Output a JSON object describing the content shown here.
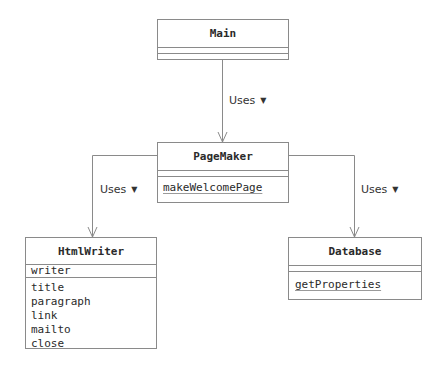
{
  "diagram": {
    "type": "UML class diagram",
    "classes": [
      {
        "id": "main",
        "name": "Main",
        "attributes": [],
        "operations": []
      },
      {
        "id": "pagemaker",
        "name": "PageMaker",
        "attributes": [],
        "operations": [
          {
            "name": "makeWelcomePage",
            "static": true
          }
        ]
      },
      {
        "id": "htmlwriter",
        "name": "HtmlWriter",
        "attributes": [
          {
            "name": "writer"
          }
        ],
        "operations": [
          {
            "name": "title"
          },
          {
            "name": "paragraph"
          },
          {
            "name": "link"
          },
          {
            "name": "mailto"
          },
          {
            "name": "close"
          }
        ]
      },
      {
        "id": "database",
        "name": "Database",
        "attributes": [],
        "operations": [
          {
            "name": "getProperties",
            "static": true
          }
        ]
      }
    ],
    "relations": [
      {
        "from": "Main",
        "to": "PageMaker",
        "label": "Uses",
        "direction_icon": "▼"
      },
      {
        "from": "PageMaker",
        "to": "HtmlWriter",
        "label": "Uses",
        "direction_icon": "▼"
      },
      {
        "from": "PageMaker",
        "to": "Database",
        "label": "Uses",
        "direction_icon": "▼"
      }
    ]
  },
  "colors": {
    "line": "#8a8a8a",
    "text": "#2a2a2a",
    "background": "#ffffff"
  }
}
